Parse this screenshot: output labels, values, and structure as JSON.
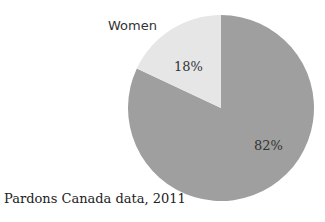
{
  "chart_data": {
    "type": "pie",
    "title": "",
    "categories": [
      "Women",
      "Men"
    ],
    "values": [
      18,
      82
    ],
    "labels": [
      "18%",
      "82%"
    ],
    "legend": [
      "Women"
    ],
    "colors": [
      "#e6e6e6",
      "#9f9f9f"
    ],
    "caption": "Pardons Canada data, 2011"
  },
  "labels": {
    "women": "Women",
    "women_pct": "18%",
    "men_pct": "82%",
    "caption": "Pardons Canada data, 2011"
  }
}
